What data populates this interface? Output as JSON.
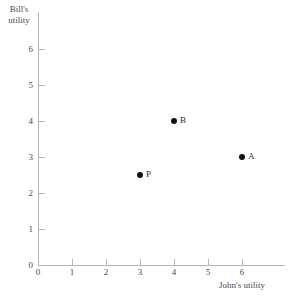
{
  "chart_data": {
    "type": "scatter",
    "title": "",
    "xlabel": "John's utility",
    "ylabel": "Bill's\nutility",
    "xlim": [
      0,
      6
    ],
    "ylim": [
      0,
      6
    ],
    "xticks": [
      0,
      1,
      2,
      3,
      4,
      5,
      6
    ],
    "yticks": [
      0,
      1,
      2,
      3,
      4,
      5,
      6
    ],
    "xtick_labels": [
      "0",
      "1",
      "2",
      "3",
      "4",
      "5",
      "6"
    ],
    "ytick_labels": [
      "0",
      "1",
      "2",
      "3",
      "4",
      "5",
      "6"
    ],
    "grid": false,
    "legend": false,
    "point_color": "#111111",
    "axis_color": "#b5b5b5",
    "points": [
      {
        "label": "A",
        "x": 6,
        "y": 3
      },
      {
        "label": "B",
        "x": 4,
        "y": 4
      },
      {
        "label": "P",
        "x": 3,
        "y": 2.5
      }
    ]
  }
}
